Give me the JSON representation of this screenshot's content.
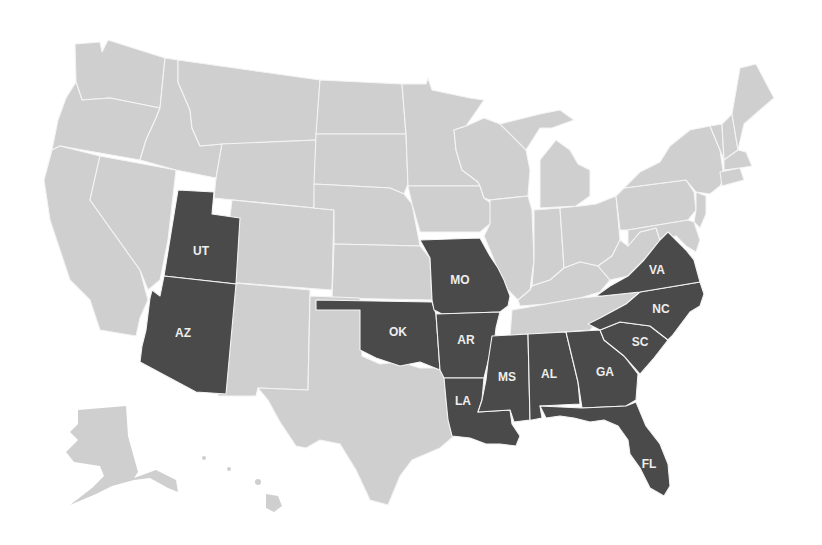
{
  "map": {
    "title": "",
    "colors": {
      "background": "#ffffff",
      "base_state": "#cfcfcf",
      "highlighted_state": "#4a4a4a",
      "border": "#f4f4f4",
      "label": "#eeeeee"
    },
    "highlighted_states": [
      {
        "code": "UT",
        "label": "UT"
      },
      {
        "code": "AZ",
        "label": "AZ"
      },
      {
        "code": "OK",
        "label": "OK"
      },
      {
        "code": "MO",
        "label": "MO"
      },
      {
        "code": "AR",
        "label": "AR"
      },
      {
        "code": "LA",
        "label": "LA"
      },
      {
        "code": "MS",
        "label": "MS"
      },
      {
        "code": "AL",
        "label": "AL"
      },
      {
        "code": "GA",
        "label": "GA"
      },
      {
        "code": "SC",
        "label": "SC"
      },
      {
        "code": "NC",
        "label": "NC"
      },
      {
        "code": "VA",
        "label": "VA"
      },
      {
        "code": "FL",
        "label": "FL"
      }
    ],
    "labels": {
      "UT": "UT",
      "AZ": "AZ",
      "OK": "OK",
      "MO": "MO",
      "AR": "AR",
      "LA": "LA",
      "MS": "MS",
      "AL": "AL",
      "GA": "GA",
      "SC": "SC",
      "NC": "NC",
      "VA": "VA",
      "FL": "FL"
    },
    "insets": [
      "Alaska",
      "Hawaii"
    ]
  }
}
